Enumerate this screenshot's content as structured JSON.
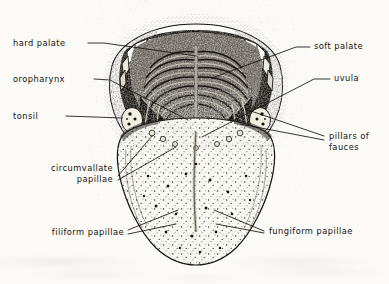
{
  "figure": {
    "type": "anatomical-line-drawing",
    "background_color": "#fbfaf6",
    "ink_color": "#15130f"
  },
  "labels": {
    "hard_palate": "hard palate",
    "oropharynx": "oropharynx",
    "tonsil": "tonsil",
    "circumvallate_line1": "circumvallate",
    "circumvallate_line2": "papillae",
    "filiform_papillae": "filiform papillae",
    "soft_palate": "soft palate",
    "uvula": "uvula",
    "pillars_line1": "pillars of",
    "pillars_line2": "fauces",
    "fungiform_papillae": "fungiform papillae"
  }
}
